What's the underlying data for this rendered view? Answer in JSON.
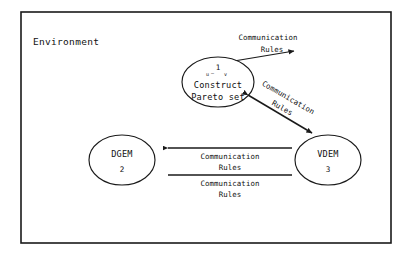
{
  "diagram": {
    "title": "Environment",
    "frame_label": "Environment",
    "background_color": "#ffffff",
    "line_color": "#1a1a1a",
    "nodes": [
      {
        "id": "construct-pareto-set",
        "number": "1",
        "sub_left": "u",
        "sub_right": "v",
        "sub_separator": "—",
        "line1": "Construct",
        "line2": "Pareto set",
        "shape": "ellipse"
      },
      {
        "id": "dgem",
        "name": "DGEM",
        "number": "2",
        "shape": "ellipse"
      },
      {
        "id": "vdem",
        "name": "VDEM",
        "number": "3",
        "shape": "ellipse"
      }
    ],
    "edges": [
      {
        "id": "edge-top-right",
        "label_line1": "Communication",
        "label_line2": "Rules",
        "orientation": "diagonal-up-right",
        "arrow": "end"
      },
      {
        "id": "edge-node1-to-vdem",
        "label_line1": "Communication",
        "label_line2": "Rules",
        "orientation": "diagonal-down-right",
        "arrow": "both"
      },
      {
        "id": "edge-dgem-vdem-upper",
        "label_line1": "Communication",
        "label_line2": "Rules",
        "orientation": "horizontal",
        "arrow": "start"
      },
      {
        "id": "edge-dgem-vdem-lower",
        "label_line1": "Communication",
        "label_line2": "Rules",
        "orientation": "horizontal",
        "arrow": "none"
      }
    ]
  }
}
